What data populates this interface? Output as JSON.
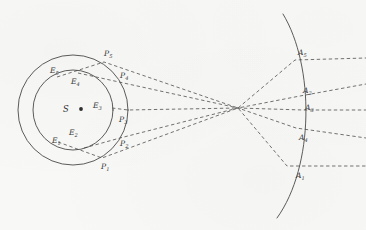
{
  "figure": {
    "type": "optical-ray-diagram",
    "background_color": "#f8f8f6",
    "line_color": "#4a4a4a",
    "ray_color": "#5a5a5a",
    "width": 366,
    "height": 230
  },
  "source": {
    "label": "S",
    "x": 73,
    "y": 110,
    "dot_radius": 1.9
  },
  "circles": [
    {
      "name": "inner-wavefront",
      "cx": 73,
      "cy": 110,
      "r": 40
    },
    {
      "name": "outer-wavefront",
      "cx": 73,
      "cy": 110,
      "r": 55
    }
  ],
  "arc": {
    "name": "receiving-arc",
    "start_x": 283,
    "start_y": 14,
    "end_x": 277,
    "end_y": 218,
    "apex_x": 306,
    "apex_y": 112
  },
  "focus": {
    "x": 238,
    "y": 108
  },
  "inner_points": [
    {
      "label": "E",
      "sub": "5",
      "x": 57,
      "y": 77,
      "lx": 50,
      "ly": 73
    },
    {
      "label": "E",
      "sub": "4",
      "x": 78,
      "y": 73,
      "lx": 71,
      "ly": 84
    },
    {
      "label": "E",
      "sub": "3",
      "x": 112,
      "y": 108,
      "lx": 93,
      "ly": 108
    },
    {
      "label": "E",
      "sub": "2",
      "x": 84,
      "y": 148,
      "lx": 69,
      "ly": 135
    },
    {
      "label": "E",
      "sub": "1",
      "x": 58,
      "y": 142,
      "lx": 52,
      "ly": 143
    }
  ],
  "outer_points": [
    {
      "label": "P",
      "sub": "5",
      "x": 104,
      "y": 62,
      "lx": 104,
      "ly": 56
    },
    {
      "label": "P",
      "sub": "4",
      "x": 119,
      "y": 82,
      "lx": 120,
      "ly": 78
    },
    {
      "label": "P",
      "sub": "3",
      "x": 128,
      "y": 110,
      "lx": 119,
      "ly": 122
    },
    {
      "label": "P",
      "sub": "2",
      "x": 120,
      "y": 138,
      "lx": 120,
      "ly": 146
    },
    {
      "label": "P",
      "sub": "1",
      "x": 102,
      "y": 158,
      "lx": 101,
      "ly": 169
    }
  ],
  "arc_points": [
    {
      "label": "A",
      "sub": "5",
      "x": 295,
      "y": 60,
      "lx": 298,
      "ly": 55
    },
    {
      "label": "A",
      "sub": "2",
      "x": 300,
      "y": 96,
      "lx": 303,
      "ly": 93
    },
    {
      "label": "A",
      "sub": "3",
      "x": 303,
      "y": 110,
      "lx": 305,
      "ly": 110
    },
    {
      "label": "A",
      "sub": "4",
      "x": 296,
      "y": 128,
      "lx": 299,
      "ly": 140
    },
    {
      "label": "A",
      "sub": "1",
      "x": 287,
      "y": 166,
      "lx": 296,
      "ly": 178
    }
  ],
  "rays": [
    {
      "name": "ray-1",
      "from": "E5",
      "via": "P5",
      "to": "A1",
      "x1": 57,
      "y1": 77,
      "x2": 104,
      "y2": 62,
      "fx": 238,
      "fy": 108,
      "x3": 287,
      "y3": 166,
      "x4": 366,
      "y4": 166
    },
    {
      "name": "ray-2",
      "from": "E4",
      "via": "P4",
      "to": "A4",
      "x1": 78,
      "y1": 73,
      "x2": 119,
      "y2": 82,
      "fx": 238,
      "fy": 108,
      "x3": 296,
      "y3": 128,
      "x4": 366,
      "y4": 138
    },
    {
      "name": "ray-3",
      "from": "E3",
      "via": "P3",
      "to": "A3",
      "x1": 112,
      "y1": 108,
      "x2": 128,
      "y2": 110,
      "fx": 238,
      "fy": 108,
      "x3": 303,
      "y3": 110,
      "x4": 366,
      "y4": 110
    },
    {
      "name": "ray-4",
      "from": "E2",
      "via": "P2",
      "to": "A2",
      "x1": 84,
      "y1": 148,
      "x2": 120,
      "y2": 138,
      "fx": 238,
      "fy": 108,
      "x3": 300,
      "y3": 96,
      "x4": 366,
      "y4": 84
    },
    {
      "name": "ray-5",
      "from": "E1",
      "via": "P1",
      "to": "A5",
      "x1": 58,
      "y1": 142,
      "x2": 102,
      "y2": 158,
      "fx": 238,
      "fy": 108,
      "x3": 295,
      "y3": 60,
      "x4": 366,
      "y4": 58
    }
  ]
}
